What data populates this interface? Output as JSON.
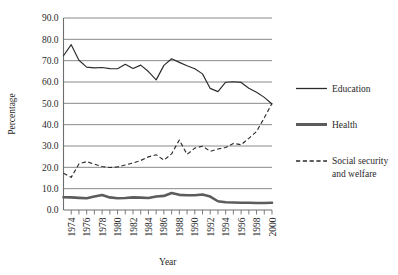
{
  "chart_data": {
    "type": "line",
    "title": "",
    "xlabel": "Year",
    "ylabel": "Percentage",
    "ylim": [
      0,
      90
    ],
    "xlim": [
      1973,
      2000
    ],
    "grid": true,
    "legend_position": "right",
    "ytick_labels": [
      "0.0",
      "10.0",
      "20.0",
      "30.0",
      "40.0",
      "50.0",
      "60.0",
      "70.0",
      "80.0",
      "90.0"
    ],
    "ytick_values": [
      0,
      10,
      20,
      30,
      40,
      50,
      60,
      70,
      80,
      90
    ],
    "xtick_labels": [
      "1974",
      "1976",
      "1978",
      "1980",
      "1982",
      "1984",
      "1986",
      "1988",
      "1990",
      "1992",
      "1994",
      "1996",
      "1998",
      "2000"
    ],
    "xtick_values": [
      1974,
      1976,
      1978,
      1980,
      1982,
      1984,
      1986,
      1988,
      1990,
      1992,
      1994,
      1996,
      1998,
      2000
    ],
    "x": [
      1973,
      1974,
      1975,
      1976,
      1977,
      1978,
      1979,
      1980,
      1981,
      1982,
      1983,
      1984,
      1985,
      1986,
      1987,
      1988,
      1989,
      1990,
      1991,
      1992,
      1993,
      1994,
      1995,
      1996,
      1997,
      1998,
      1999,
      2000
    ],
    "series": [
      {
        "name": "Education",
        "style": "solid-thin",
        "color": "#2b2b2b",
        "values": [
          72.3,
          77.5,
          70.2,
          67.0,
          66.6,
          66.8,
          66.3,
          66.2,
          68.3,
          66.3,
          67.9,
          64.9,
          61.0,
          67.8,
          70.9,
          69.2,
          67.6,
          66.2,
          63.8,
          57.0,
          55.5,
          59.9,
          60.1,
          59.8,
          57.1,
          55.2,
          52.8,
          49.7
        ]
      },
      {
        "name": "Health",
        "style": "solid-thick",
        "color": "#5c5c5c",
        "values": [
          6.0,
          5.9,
          5.7,
          5.5,
          6.3,
          7.0,
          5.9,
          5.5,
          5.6,
          5.9,
          5.8,
          5.6,
          6.3,
          6.6,
          8.0,
          7.1,
          6.9,
          6.9,
          7.3,
          6.3,
          4.1,
          3.6,
          3.5,
          3.4,
          3.4,
          3.3,
          3.3,
          3.4
        ]
      },
      {
        "name": "Social security and welfare",
        "style": "dashed",
        "color": "#2b2b2b",
        "values": [
          17.2,
          15.3,
          21.6,
          22.7,
          21.5,
          20.4,
          19.9,
          20.2,
          21.1,
          22.0,
          23.2,
          24.9,
          25.9,
          23.4,
          26.3,
          32.8,
          26.1,
          29.0,
          29.9,
          27.5,
          28.6,
          29.3,
          31.2,
          30.6,
          33.6,
          36.8,
          43.2,
          50.0
        ]
      }
    ],
    "legend": [
      {
        "label": "Education",
        "style": "solid-thin"
      },
      {
        "label": "Health",
        "style": "solid-thick"
      },
      {
        "label": "Social security",
        "label2": "and welfare",
        "style": "dashed"
      }
    ]
  }
}
